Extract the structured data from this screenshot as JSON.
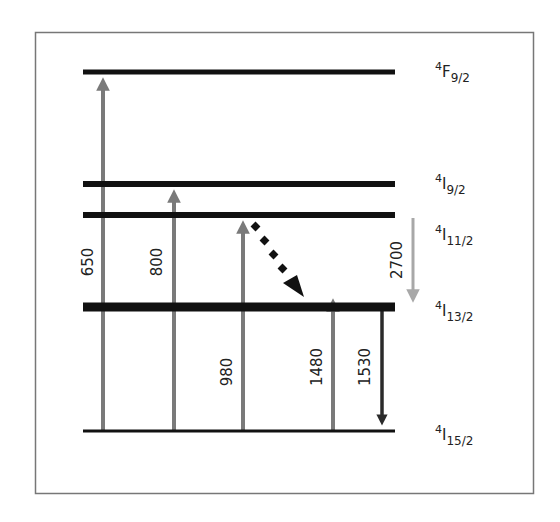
{
  "diagram": {
    "levels": [
      {
        "id": "F9_2",
        "sup": "4",
        "base": "F",
        "sub": "9/2",
        "y": 72,
        "thickness": 5
      },
      {
        "id": "I9_2",
        "sup": "4",
        "base": "I",
        "sub": "9/2",
        "y": 184,
        "thickness": 6
      },
      {
        "id": "I11_2",
        "sup": "4",
        "base": "I",
        "sub": "11/2",
        "y": 215,
        "thickness": 6
      },
      {
        "id": "I13_2",
        "sup": "4",
        "base": "I",
        "sub": "13/2",
        "y": 307,
        "thickness": 9
      },
      {
        "id": "I15_2",
        "sup": "4",
        "base": "I",
        "sub": "15/2",
        "y": 431,
        "thickness": 3
      }
    ],
    "transitions": [
      {
        "label": "650",
        "x": 103,
        "from": "I15_2",
        "to": "F9_2",
        "direction": "up",
        "color": "#7a7a7a"
      },
      {
        "label": "800",
        "x": 174,
        "from": "I15_2",
        "to": "I9_2",
        "direction": "up",
        "color": "#7a7a7a"
      },
      {
        "label": "980",
        "x": 243,
        "from": "I15_2",
        "to": "I11_2",
        "direction": "up",
        "color": "#7a7a7a"
      },
      {
        "label": "1480",
        "x": 333,
        "from": "I15_2",
        "to": "I13_2",
        "direction": "up",
        "color": "#7a7a7a"
      },
      {
        "label": "1530",
        "x": 382,
        "from": "I13_2",
        "to": "I15_2",
        "direction": "down",
        "color": "#2a2a2a"
      },
      {
        "label": "2700",
        "x": 413,
        "from": "I11_2",
        "to": "I13_2",
        "direction": "down",
        "color": "#a8a8a8"
      }
    ],
    "nonradiative": {
      "from": "I11_2",
      "to": "I13_2",
      "style": "dotted",
      "color": "#111111"
    },
    "colors": {
      "level": "#111111",
      "frame": "#777777",
      "pump_arrow": "#7a7a7a",
      "emission_arrow": "#2a2a2a",
      "mir_arrow": "#a8a8a8"
    }
  }
}
